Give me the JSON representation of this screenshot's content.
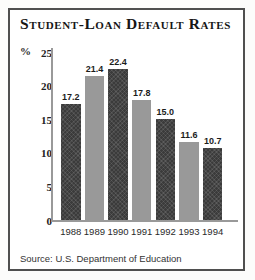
{
  "chart_data": {
    "type": "bar",
    "title": "Student-Loan Default Rates",
    "unit_label": "%",
    "categories": [
      "1988",
      "1989",
      "1990",
      "1991",
      "1992",
      "1993",
      "1994"
    ],
    "values": [
      17.2,
      21.4,
      22.4,
      17.8,
      15.0,
      11.6,
      10.7
    ],
    "value_labels": [
      "17.2",
      "21.4",
      "22.4",
      "17.8",
      "15.0",
      "11.6",
      "10.7"
    ],
    "ylim": [
      0,
      25
    ],
    "yticks": [
      0,
      5,
      10,
      15,
      20,
      25
    ],
    "grid": false,
    "legend": null,
    "source": "Source: U.S. Department of Education",
    "bar_color_pattern": [
      "dark",
      "light",
      "dark",
      "light",
      "dark",
      "light",
      "dark"
    ],
    "colors": {
      "dark": "#3b3b3b",
      "light": "#999999",
      "axis": "#999999",
      "text": "#1c1c1c"
    }
  }
}
